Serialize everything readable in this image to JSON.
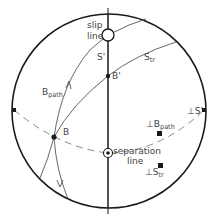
{
  "colors": {
    "ink": "#1a1a1a",
    "thin": "#555555",
    "dash": "#8a8a8a",
    "text": "#444444",
    "bg": "#ffffff"
  },
  "labels": {
    "slip_line_1": "slip",
    "slip_line_2": "line",
    "s_prime": "S'",
    "b_prime": "B'",
    "s_tr_main": "S",
    "s_tr_sub": "tr",
    "b_path_main": "B",
    "b_path_sub": "path",
    "b": "B",
    "perp_s_prime": "⊥S'",
    "perp_b_path_main": "⊥B",
    "perp_b_path_sub": "path",
    "separation_1": "separation",
    "separation_2": "line",
    "perp_s_tr_main": "⊥S",
    "perp_s_tr_sub": "tr"
  }
}
